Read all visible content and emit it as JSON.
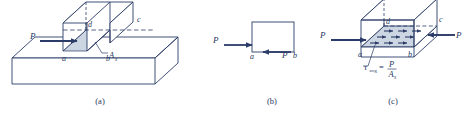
{
  "figure": {
    "background": "#ffffff",
    "line_color": "#2b3c68",
    "fill_shade": "#ccd5e2",
    "fill_block": "#ffffff",
    "panels": [
      {
        "id": "a",
        "caption": "(a)",
        "description": "Block resting on a base with shear plane highlighted; force P applied horizontally.",
        "labels": {
          "force_left": "P",
          "vertex_a": "a",
          "vertex_b": "b",
          "vertex_c": "c",
          "vertex_d": "d",
          "area_symbol": "A",
          "area_subscript": "s"
        }
      },
      {
        "id": "b",
        "caption": "(b)",
        "description": "Free body diagram: rectangle with applied force P and reacting shear force P.",
        "labels": {
          "force_left": "P",
          "force_right": "P",
          "vertex_a": "a",
          "vertex_b": "b"
        }
      },
      {
        "id": "c",
        "caption": "(c)",
        "description": "Average shear stress distributed over the shear area with opposing forces P.",
        "labels": {
          "force_left": "P",
          "force_right": "P",
          "vertex_a": "a",
          "vertex_b": "b",
          "vertex_c": "c",
          "vertex_d": "d",
          "stress_symbol": "τ",
          "stress_subscript": "avg",
          "equals": "=",
          "numerator": "P",
          "denominator_symbol": "A",
          "denominator_subscript": "s"
        }
      }
    ]
  }
}
